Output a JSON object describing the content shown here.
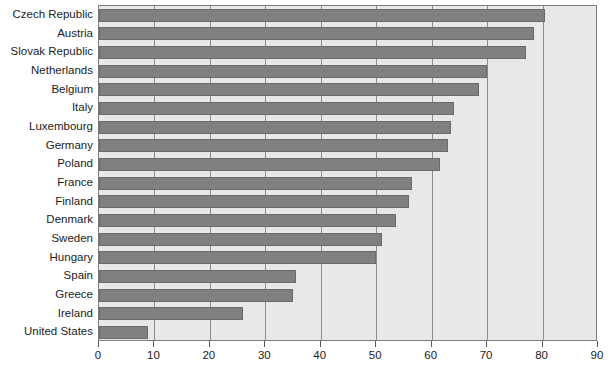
{
  "chart_data": {
    "type": "bar",
    "orientation": "horizontal",
    "title": "",
    "subtitle": "",
    "xlabel": "",
    "ylabel": "",
    "xlim": [
      0,
      90
    ],
    "ylim": null,
    "grid": true,
    "legend": null,
    "legend_position": "none",
    "xticks": [
      0,
      10,
      20,
      30,
      40,
      50,
      60,
      70,
      80,
      90
    ],
    "xtick_labels": [
      "0",
      "10",
      "20",
      "30",
      "40",
      "50",
      "60",
      "70",
      "80",
      "90"
    ],
    "categories": [
      "Czech Republic",
      "Austria",
      "Slovak Republic",
      "Netherlands",
      "Belgium",
      "Italy",
      "Luxembourg",
      "Germany",
      "Poland",
      "France",
      "Finland",
      "Denmark",
      "Sweden",
      "Hungary",
      "Spain",
      "Greece",
      "Ireland",
      "United States"
    ],
    "values": [
      80.5,
      78.5,
      77,
      70,
      68.5,
      64,
      63.5,
      63,
      61.5,
      56.5,
      56,
      53.5,
      51,
      50,
      35.5,
      35,
      26,
      8.8
    ],
    "series": [
      {
        "name": "",
        "values": [
          80.5,
          78.5,
          77,
          70,
          68.5,
          64,
          63.5,
          63,
          61.5,
          56.5,
          56,
          53.5,
          51,
          50,
          35.5,
          35,
          26,
          8.8
        ]
      }
    ]
  },
  "colors": {
    "bar_fill": "#80807e",
    "bar_border": "#6a6a68",
    "plot_background": "#e8e8e6",
    "plot_border": "#7c7c7a",
    "gridline": "#8c8c8a",
    "text": "#1c1c1c",
    "page_background": "#ffffff"
  }
}
